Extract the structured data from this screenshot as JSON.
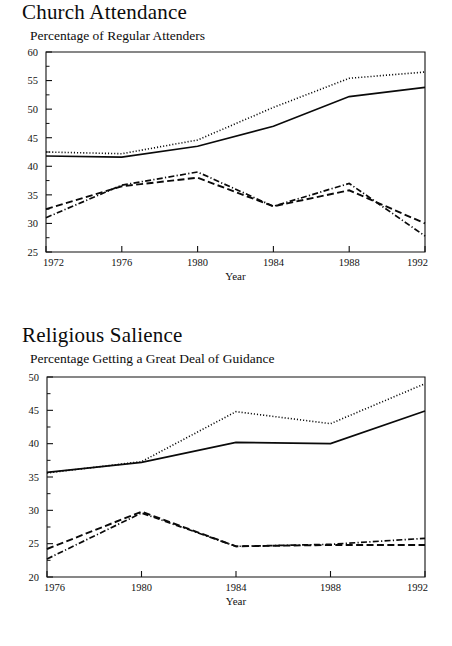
{
  "page": {
    "background": "#ffffff",
    "ink": "#111111"
  },
  "figures": [
    {
      "id": "church-attendance",
      "title": "Church Attendance",
      "subtitle": "Percentage of Regular Attenders",
      "chart_data": {
        "type": "line",
        "title": "Church Attendance",
        "subtitle": "Percentage of Regular Attenders",
        "xlabel": "Year",
        "ylabel": "",
        "x": [
          1972,
          1976,
          1980,
          1984,
          1988,
          1992
        ],
        "xlim": [
          1972,
          1992
        ],
        "ylim": [
          25,
          60
        ],
        "ytick_step": 5,
        "yticks": [
          25,
          30,
          35,
          40,
          45,
          50,
          55,
          60
        ],
        "xticks": [
          1972,
          1976,
          1980,
          1984,
          1988,
          1992
        ],
        "xtick_labels": [
          "1972",
          "1976",
          "1980",
          "1984",
          "1988",
          "1992"
        ],
        "ytick_labels": [
          "25",
          "30",
          "35",
          "40",
          "45",
          "50",
          "55",
          "60"
        ],
        "grid": false,
        "legend": "none",
        "series": [
          {
            "name": "series-solid",
            "style": "solid",
            "values": [
              41.8,
              41.6,
              43.5,
              47.0,
              52.2,
              53.8
            ]
          },
          {
            "name": "series-dotted",
            "style": "dotted",
            "values": [
              42.5,
              42.2,
              44.6,
              50.3,
              55.4,
              56.5
            ]
          },
          {
            "name": "series-dashed",
            "style": "dashed",
            "values": [
              32.5,
              36.5,
              38.0,
              33.0,
              35.8,
              30.0
            ]
          },
          {
            "name": "series-dashdot",
            "style": "dashdot",
            "values": [
              31.0,
              36.7,
              39.0,
              33.0,
              37.0,
              27.8
            ]
          }
        ]
      }
    },
    {
      "id": "religious-salience",
      "title": "Religious Salience",
      "subtitle": "Percentage Getting a Great Deal of Guidance",
      "chart_data": {
        "type": "line",
        "title": "Religious Salience",
        "subtitle": "Percentage Getting a Great Deal of Guidance",
        "xlabel": "Year",
        "ylabel": "",
        "x": [
          1976,
          1980,
          1984,
          1988,
          1992
        ],
        "xlim": [
          1976,
          1992
        ],
        "ylim": [
          20,
          50
        ],
        "ytick_step": 5,
        "yticks": [
          20,
          25,
          30,
          35,
          40,
          45,
          50
        ],
        "xticks": [
          1976,
          1980,
          1984,
          1988,
          1992
        ],
        "xtick_labels": [
          "1976",
          "1980",
          "1984",
          "1988",
          "1992"
        ],
        "ytick_labels": [
          "20",
          "25",
          "30",
          "35",
          "40",
          "45",
          "50"
        ],
        "grid": false,
        "legend": "none",
        "series": [
          {
            "name": "series-solid",
            "style": "solid",
            "values": [
              35.7,
              37.2,
              40.2,
              40.0,
              44.9
            ]
          },
          {
            "name": "series-dotted",
            "style": "dotted",
            "values": [
              35.6,
              37.3,
              44.8,
              43.0,
              49.0
            ]
          },
          {
            "name": "series-dashed",
            "style": "dashed",
            "values": [
              24.2,
              29.8,
              24.6,
              24.8,
              24.8
            ]
          },
          {
            "name": "series-dashdot",
            "style": "dashdot",
            "values": [
              22.7,
              29.6,
              24.6,
              24.9,
              25.8
            ]
          }
        ]
      }
    }
  ]
}
